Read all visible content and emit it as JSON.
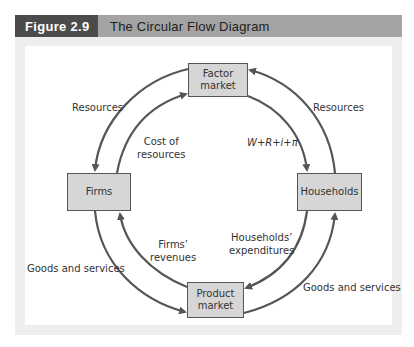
{
  "figure": {
    "number": "Figure 2.9",
    "title": "The Circular Flow Diagram"
  },
  "nodes": {
    "factor_market": {
      "line1": "Factor",
      "line2": "market"
    },
    "firms": "Firms",
    "households": "Households",
    "product_market": {
      "line1": "Product",
      "line2": "market"
    }
  },
  "labels": {
    "resources_left": "Resources",
    "resources_right": "Resources",
    "cost_of_resources": {
      "line1": "Cost of",
      "line2": "resources"
    },
    "income_formula": "W+R+i+π",
    "firms_revenues": {
      "line1": "Firms’",
      "line2": "revenues"
    },
    "households_expenditures": {
      "line1": "Households’",
      "line2": "expenditures"
    },
    "goods_services_left": "Goods and services",
    "goods_services_right": "Goods and services"
  },
  "colors": {
    "header_dark": "#4b4b4b",
    "header_light": "#a3a3a3",
    "box_fill": "#d6d6d6",
    "arrow": "#555555"
  }
}
